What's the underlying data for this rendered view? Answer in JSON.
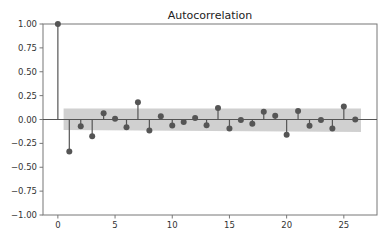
{
  "chart_data": {
    "type": "stem",
    "title": "Autocorrelation",
    "xlabel": "",
    "ylabel": "",
    "xlim": [
      -1.3,
      27.9
    ],
    "ylim": [
      -1.0,
      1.0
    ],
    "grid": false,
    "legend": null,
    "x_ticks": [
      0,
      5,
      10,
      15,
      20,
      25
    ],
    "x_tick_labels": [
      "0",
      "5",
      "10",
      "15",
      "20",
      "25"
    ],
    "y_ticks": [
      1.0,
      0.75,
      0.5,
      0.25,
      0.0,
      -0.25,
      -0.5,
      -0.75,
      -1.0
    ],
    "y_tick_labels": [
      "1.00",
      "0.75",
      "0.50",
      "0.25",
      "0.00",
      "−0.25",
      "−0.50",
      "−0.75",
      "−1.00"
    ],
    "lags": [
      0,
      1,
      2,
      3,
      4,
      5,
      6,
      7,
      8,
      9,
      10,
      11,
      12,
      13,
      14,
      15,
      16,
      17,
      18,
      19,
      20,
      21,
      22,
      23,
      24,
      25,
      26
    ],
    "values": [
      1.0,
      -0.335,
      -0.07,
      -0.175,
      0.066,
      0.007,
      -0.08,
      0.18,
      -0.115,
      0.035,
      -0.063,
      -0.025,
      0.017,
      -0.06,
      0.12,
      -0.095,
      -0.005,
      -0.045,
      0.08,
      0.04,
      -0.16,
      0.09,
      -0.065,
      -0.005,
      -0.095,
      0.135,
      0.0
    ],
    "confidence_band": {
      "x_start": 0.5,
      "x_end": 26.5,
      "upper": 0.115,
      "lower_start": -0.11,
      "lower_end": -0.13
    },
    "colors": {
      "marker": "#555555",
      "stem": "#555555",
      "band": "#c8c8c8",
      "axis": "#777777"
    }
  }
}
